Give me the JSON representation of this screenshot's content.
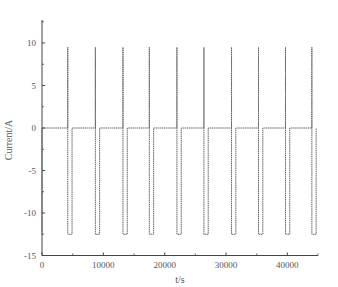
{
  "chart_data": {
    "type": "line",
    "title": "",
    "xlabel": "t/s",
    "ylabel": "Current/A",
    "xlim": [
      0,
      45000
    ],
    "ylim": [
      -15,
      12.5
    ],
    "xticks": [
      0,
      10000,
      20000,
      30000,
      40000
    ],
    "xtick_labels": [
      "0",
      "10000",
      "20000",
      "30000",
      "40000"
    ],
    "yticks": [
      10,
      5,
      0,
      -5,
      -10,
      -15
    ],
    "ytick_labels": [
      "10",
      "5",
      "0",
      "-5",
      "-10",
      "-15"
    ],
    "grid": false,
    "legend": null,
    "series": [
      {
        "name": "Current",
        "color": "#666666",
        "baseline": 0,
        "spike_peak": 9.5,
        "pulse_low": -12.5,
        "pulse_width_s": 700,
        "pulse_start_times_s": [
          0,
          4200,
          8700,
          13200,
          17500,
          22000,
          26400,
          30900,
          35300,
          39700,
          44000
        ],
        "description": "Periodic pulses: brief spike to ~9.5 A followed by a low plateau at ~-12.5 A, then return to 0 A"
      }
    ]
  }
}
